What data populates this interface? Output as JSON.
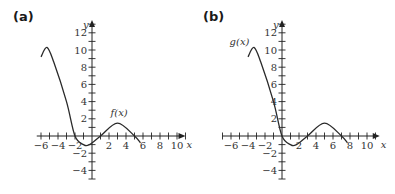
{
  "panels": [
    {
      "label": "(a)",
      "function_label": "f(x)"
    },
    {
      "label": "(b)",
      "function_label": "g(x)"
    }
  ],
  "chart_data": [
    {
      "type": "line",
      "title": "(a)",
      "xlabel": "x",
      "ylabel": "y",
      "xlim": [
        -6.5,
        11
      ],
      "ylim": [
        -5,
        13.5
      ],
      "x_ticks": [
        -6,
        -4,
        -2,
        2,
        4,
        6,
        8,
        10
      ],
      "y_ticks": [
        -4,
        -2,
        2,
        4,
        6,
        8,
        10,
        12
      ],
      "grid": false,
      "series": [
        {
          "name": "f(x)",
          "x": [
            -6,
            -5.3,
            -4.5,
            -3,
            -2,
            -1,
            -0.3,
            1,
            3,
            5,
            5.7
          ],
          "y": [
            9.2,
            10.3,
            8.6,
            4,
            0,
            -1,
            -1,
            0,
            1.5,
            0,
            -0.8
          ]
        }
      ],
      "annotations": [
        {
          "text": "f(x)",
          "x": 3.2,
          "y": 2.3
        }
      ]
    },
    {
      "type": "line",
      "title": "(b)",
      "xlabel": "x",
      "ylabel": "y",
      "xlim": [
        -7,
        11.5
      ],
      "ylim": [
        -5,
        13.5
      ],
      "x_ticks": [
        -6,
        -4,
        -2,
        2,
        4,
        6,
        8,
        10
      ],
      "y_ticks": [
        -4,
        -2,
        2,
        4,
        6,
        8,
        10,
        12
      ],
      "grid": false,
      "series": [
        {
          "name": "g(x)",
          "x": [
            -4,
            -3.3,
            -2.5,
            -1,
            0,
            1,
            1.7,
            3,
            5,
            7,
            7.7
          ],
          "y": [
            9.2,
            10.3,
            8.6,
            4,
            0,
            -1,
            -1,
            0,
            1.5,
            0,
            -0.8
          ]
        }
      ],
      "annotations": [
        {
          "text": "g(x)",
          "x": -5,
          "y": 10.6
        }
      ]
    }
  ]
}
